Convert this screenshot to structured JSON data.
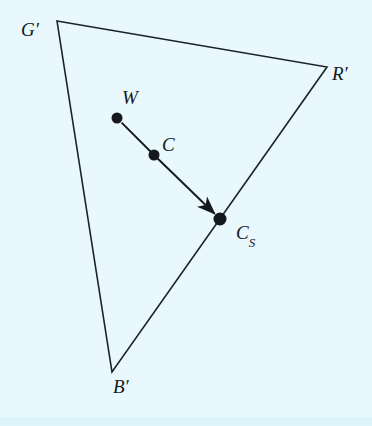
{
  "figure": {
    "kind": "geometric-diagram",
    "background_color": "#e9f8fc",
    "stroke_color": "#1b2328",
    "dot_color": "#15191d",
    "stroke_width": 1.6,
    "canvas": {
      "width": 372,
      "height": 426
    },
    "triangle": {
      "name": "primaries-triangle",
      "vertices": [
        {
          "id": "Gp",
          "label": "G′",
          "x": 57,
          "y": 21,
          "label_x": 21,
          "label_y": 20
        },
        {
          "id": "Rp",
          "label": "R′",
          "x": 327,
          "y": 67,
          "label_x": 332,
          "label_y": 64
        },
        {
          "id": "Bp",
          "label": "B′",
          "x": 112,
          "y": 372,
          "label_x": 113,
          "label_y": 377
        }
      ]
    },
    "points": [
      {
        "id": "W",
        "label": "W",
        "sub": "",
        "x": 117,
        "y": 118,
        "r": 5.5,
        "label_x": 122,
        "label_y": 88
      },
      {
        "id": "C",
        "label": "C",
        "sub": "",
        "x": 154,
        "y": 155,
        "r": 5.5,
        "label_x": 162,
        "label_y": 135
      },
      {
        "id": "Cs",
        "label": "C",
        "sub": "S",
        "x": 220,
        "y": 219,
        "r": 6.5,
        "label_x": 236,
        "label_y": 223
      }
    ],
    "arrow": {
      "name": "saturation-arrow",
      "from": "W",
      "via": "C",
      "to": "Cs",
      "head_length": 15,
      "head_width": 9
    }
  }
}
